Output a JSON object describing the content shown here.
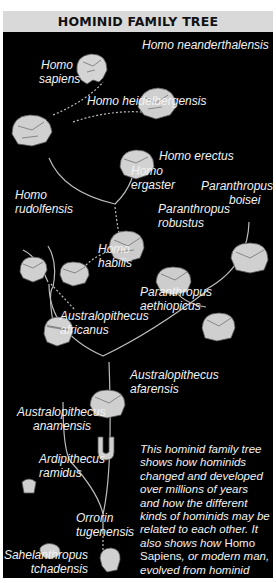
{
  "title": "HOMINID FAMILY TREE",
  "species": {
    "homo_neanderthalensis": "Homo neanderthalensis",
    "homo_sapiens_1": "Homo",
    "homo_sapiens_2": "sapiens",
    "homo_heidelbergensis": "Homo heidelbergensis",
    "homo_erectus": "Homo erectus",
    "homo_ergaster_1": "Homo",
    "homo_ergaster_2": "ergaster",
    "homo_rudolfensis_1": "Homo",
    "homo_rudolfensis_2": "rudolfensis",
    "paranthropus_boisei_1": "Paranthropus",
    "paranthropus_boisei_2": "boisei",
    "paranthropus_robustus_1": "Paranthropus",
    "paranthropus_robustus_2": "robustus",
    "homo_habilis_1": "Homo",
    "homo_habilis_2": "habilis",
    "paranthropus_aethiopicus_1": "Paranthropus",
    "paranthropus_aethiopicus_2": "aethiopicus",
    "australopithecus_africanus_1": "Australopithecus",
    "australopithecus_africanus_2": "africanus",
    "australopithecus_afarensis_1": "Australopithecus",
    "australopithecus_afarensis_2": "afarensis",
    "australopithecus_anamensis_1": "Australopithecus",
    "australopithecus_anamensis_2": "anamensis",
    "ardipithecus_ramidus_1": "Ardipithecus",
    "ardipithecus_ramidus_2": "ramidus",
    "orrorin_tugenensis_1": "Orrorin",
    "orrorin_tugenensis_2": "tugenensis",
    "sahelanthropus_tchadensis_1": "Sahelanthropus",
    "sahelanthropus_tchadensis_2": "tchadensis"
  },
  "description": {
    "part1": "This hominid family tree shows how hominids changed and developed over millions of years and how the different kinds of hominids may be related to each other. It also shows how ",
    "highlight": "Homo Sapiens",
    "part2": ", or modern man, evolved from hominid origins."
  },
  "colors": {
    "title_bar": "#d9d9d9",
    "panel": "#000000",
    "text": "#f2f2f2",
    "lines": "#bfbfbf",
    "skull": "#d8d8d8"
  }
}
